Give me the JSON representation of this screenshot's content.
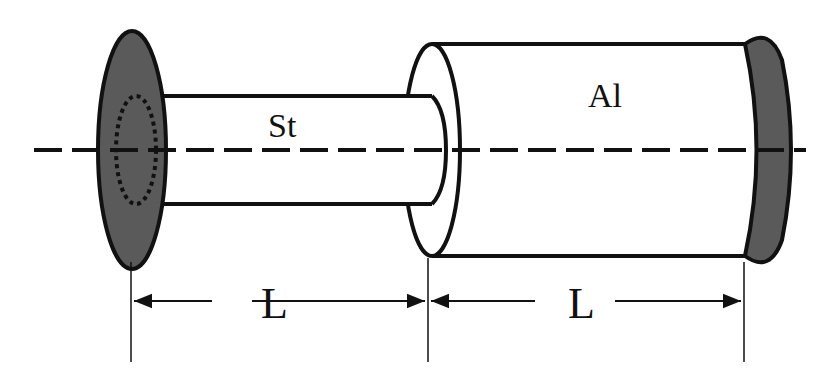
{
  "diagram": {
    "type": "composite shaft (two segments between fixed walls)",
    "labels": {
      "steel_segment": "St",
      "aluminum_segment": "Al",
      "left_length": "L",
      "right_length": "L"
    },
    "colors": {
      "stroke": "#111111",
      "wall_fill": "#5a5a5a",
      "background": "#ffffff"
    }
  }
}
